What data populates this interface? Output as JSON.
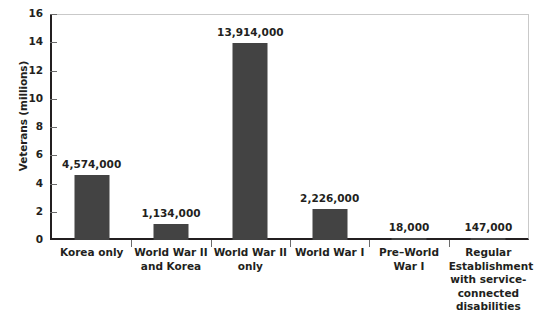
{
  "chart_data": {
    "type": "bar",
    "title": "",
    "xlabel": "",
    "ylabel": "Veterans (millions)",
    "ylim": [
      0,
      16
    ],
    "yticks": [
      0,
      2,
      4,
      6,
      8,
      10,
      12,
      14,
      16
    ],
    "ytick_labels": [
      "0",
      "2",
      "4",
      "6",
      "8",
      "10",
      "12",
      "14",
      "16"
    ],
    "grid": false,
    "legend": null,
    "bar_color": "#434343",
    "axis_color": "#231f20",
    "categories": [
      "Korea only",
      "World War II and Korea",
      "World War II only",
      "World War I",
      "Pre–World War I",
      "Regular Establishment with service-connected disabilities"
    ],
    "category_lines": [
      [
        "Korea only"
      ],
      [
        "World War II",
        "and Korea"
      ],
      [
        "World War II",
        "only"
      ],
      [
        "World War I"
      ],
      [
        "Pre–World War I"
      ],
      [
        "Regular",
        "Establishment",
        "with service-",
        "connected",
        "disabilities"
      ]
    ],
    "values": [
      4574000,
      1134000,
      13914000,
      2226000,
      18000,
      147000
    ],
    "values_millions": [
      4.574,
      1.134,
      13.914,
      2.226,
      0.018,
      0.147
    ],
    "data_labels": [
      "4,574,000",
      "1,134,000",
      "13,914,000",
      "2,226,000",
      "18,000",
      "147,000"
    ]
  },
  "axis": {
    "y_title": "Veterans (millions)",
    "y_tick_0": "0",
    "y_tick_1": "2",
    "y_tick_2": "4",
    "y_tick_3": "6",
    "y_tick_4": "8",
    "y_tick_5": "10",
    "y_tick_6": "12",
    "y_tick_7": "14",
    "y_tick_8": "16"
  }
}
